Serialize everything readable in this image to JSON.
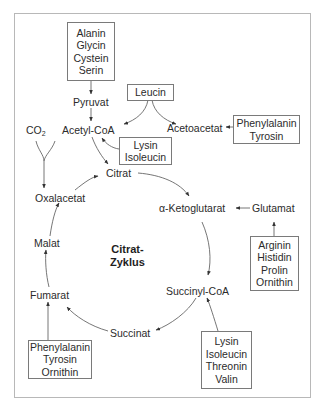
{
  "diagram": {
    "center_title_lines": [
      "Citrat-",
      "Zyklus"
    ],
    "nodes": {
      "pyruvat": "Pyruvat",
      "acetyl_coa": "Acetyl-CoA",
      "co2": "CO",
      "co2_sub": "2",
      "acetoacetat": "Acetoacetat",
      "citrat": "Citrat",
      "oxalacetat": "Oxalacetat",
      "malat": "Malat",
      "fumarat": "Fumarat",
      "succinat": "Succinat",
      "succinyl_coa": "Succinyl-CoA",
      "alpha_ketoglutarat": "α-Ketoglutarat",
      "glutamat": "Glutamat"
    },
    "amino_acid_boxes": {
      "to_pyruvat": [
        "Alanin",
        "Glycin",
        "Cystein",
        "Serin"
      ],
      "leucin": [
        "Leucin"
      ],
      "to_acetoacetat": [
        "Phenylalanin",
        "Tyrosin"
      ],
      "to_acetyl_coa": [
        "Lysin",
        "Isoleucin"
      ],
      "to_glutamat": [
        "Arginin",
        "Histidin",
        "Prolin",
        "Ornithin"
      ],
      "to_fumarat": [
        "Phenylalanin",
        "Tyrosin",
        "Ornithin"
      ],
      "to_succinyl_coa": [
        "Lysin",
        "Isoleucin",
        "Threonin",
        "Valin"
      ]
    },
    "colors": {
      "frame": "#b8b8b8",
      "box_border": "#7a7a7a",
      "arrow": "#555555",
      "text": "#2b2b2b"
    }
  }
}
